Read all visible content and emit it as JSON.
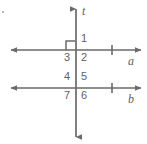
{
  "figure": {
    "background_color": "#ffffff",
    "stroke_color": "#6a6a6a",
    "text_color": "#5f5f5f",
    "stroke_width": 1.6
  },
  "lines": [
    {
      "id": "line-a",
      "label": "a",
      "orientation": "horizontal",
      "y": 50,
      "x_start": 10,
      "x_end": 142,
      "arrow_start": true,
      "arrow_end": true,
      "tick_marks": 1,
      "label_x": 128,
      "label_y": 58
    },
    {
      "id": "line-b",
      "label": "b",
      "orientation": "horizontal",
      "y": 88,
      "x_start": 10,
      "x_end": 142,
      "arrow_start": true,
      "arrow_end": true,
      "tick_marks": 1,
      "label_x": 128,
      "label_y": 96
    },
    {
      "id": "line-t",
      "label": "t",
      "orientation": "vertical",
      "x": 76,
      "y_start": 8,
      "y_end": 138,
      "arrow_start": true,
      "arrow_end": true,
      "tick_marks": 0,
      "label_x": 83,
      "label_y": 9
    }
  ],
  "right_angle_marker": {
    "id": "right-angle-marker",
    "at_intersection": "line-a",
    "quadrant": "upper-left",
    "size": 9
  },
  "angles": [
    {
      "number": "1",
      "x": 81,
      "y": 38,
      "quadrant": "upper-right",
      "at": "line-a"
    },
    {
      "number": "2",
      "x": 81,
      "y": 53,
      "quadrant": "lower-right",
      "at": "line-a"
    },
    {
      "number": "3",
      "x": 64,
      "y": 53,
      "quadrant": "lower-left",
      "at": "line-a"
    },
    {
      "number": "4",
      "x": 64,
      "y": 76,
      "quadrant": "upper-left",
      "at": "line-b"
    },
    {
      "number": "5",
      "x": 81,
      "y": 76,
      "quadrant": "upper-right",
      "at": "line-b"
    },
    {
      "number": "6",
      "x": 81,
      "y": 91,
      "quadrant": "lower-right",
      "at": "line-b"
    },
    {
      "number": "7",
      "x": 64,
      "y": 91,
      "quadrant": "lower-left",
      "at": "line-b"
    }
  ]
}
